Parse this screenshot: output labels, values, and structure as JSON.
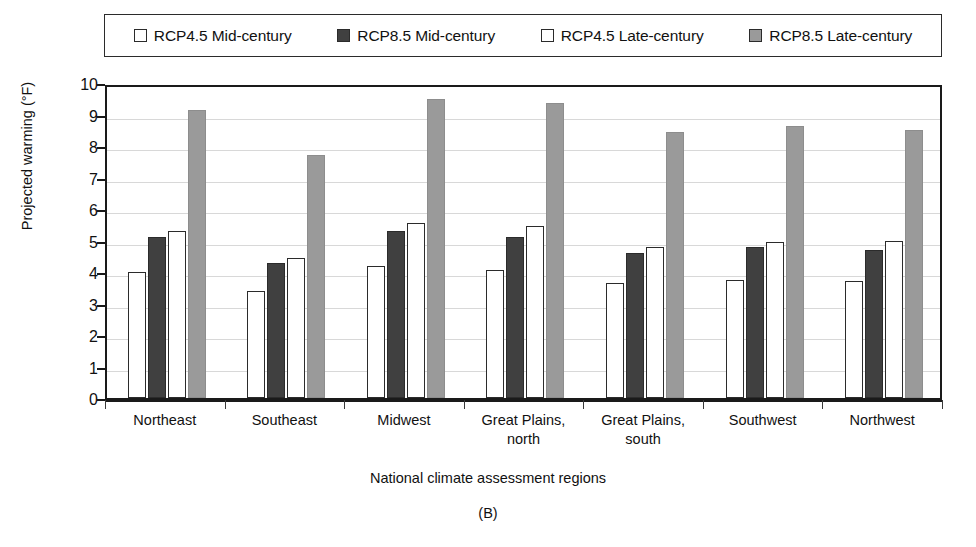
{
  "chart_data": {
    "type": "bar",
    "title": "",
    "panel_label": "(B)",
    "xlabel": "National climate assessment regions",
    "ylabel": "Projected warming (°F)",
    "ylim": [
      0,
      10
    ],
    "ytick_step": 1,
    "yticks": [
      "10",
      "9",
      "8",
      "7",
      "6",
      "5",
      "4",
      "3",
      "2",
      "1",
      "0"
    ],
    "grid": true,
    "legend_position": "top",
    "categories": [
      "Northeast",
      "Southeast",
      "Midwest",
      "Great Plains, north",
      "Great Plains, south",
      "Southwest",
      "Northwest"
    ],
    "category_lines": [
      [
        "Northeast"
      ],
      [
        "Southeast"
      ],
      [
        "Midwest"
      ],
      [
        "Great Plains,",
        "north"
      ],
      [
        "Great Plains,",
        "south"
      ],
      [
        "Southwest"
      ],
      [
        "Northwest"
      ]
    ],
    "series": [
      {
        "name": "RCP4.5 Mid-century",
        "color": "#ffffff",
        "edge": "#2b2b2b",
        "values": [
          4.0,
          3.4,
          4.2,
          4.05,
          3.65,
          3.75,
          3.7
        ]
      },
      {
        "name": "RCP8.5 Mid-century",
        "color": "#404040",
        "edge": "#2b2b2b",
        "values": [
          5.1,
          4.3,
          5.3,
          5.1,
          4.6,
          4.8,
          4.7
        ]
      },
      {
        "name": "RCP4.5 Late-century",
        "color": "#ffffff",
        "edge": "#2b2b2b",
        "values": [
          5.3,
          4.45,
          5.55,
          5.45,
          4.8,
          4.95,
          5.0
        ]
      },
      {
        "name": "RCP8.5 Late-century",
        "color": "#9a9a9a",
        "edge": "#8d8d8d",
        "values": [
          9.15,
          7.7,
          9.5,
          9.35,
          8.45,
          8.65,
          8.5
        ]
      }
    ]
  },
  "legend": {
    "entries": [
      {
        "label": "RCP4.5 Mid-century",
        "swatch": "#ffffff"
      },
      {
        "label": "RCP8.5 Mid-century",
        "swatch": "#404040"
      },
      {
        "label": "RCP4.5 Late-century",
        "swatch": "#ffffff"
      },
      {
        "label": "RCP8.5 Late-century",
        "swatch": "#9a9a9a"
      }
    ]
  }
}
